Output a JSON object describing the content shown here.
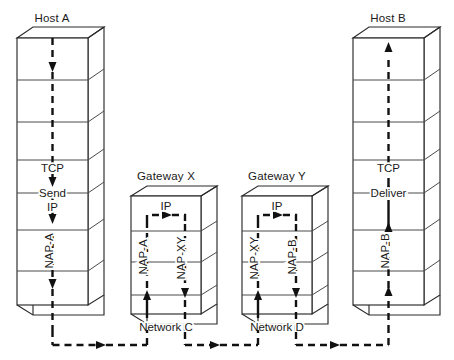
{
  "figure": {
    "kind": "network-protocol-stack-diagram",
    "background_color": "#ffffff",
    "line_color": "#2b2b2b",
    "flow_color": "#111111"
  },
  "nodes": [
    {
      "id": "host-a",
      "title": "Host A",
      "type": "host",
      "layers": 7,
      "direction": "down",
      "labels": [
        {
          "text": "TCP",
          "orientation": "horizontal"
        },
        {
          "text": "Send",
          "orientation": "horizontal"
        },
        {
          "text": "IP",
          "orientation": "horizontal"
        },
        {
          "text": "NAP-A",
          "orientation": "vertical"
        }
      ]
    },
    {
      "id": "gateway-x",
      "title": "Gateway X",
      "type": "gateway",
      "layers": 4,
      "direction": "up-across-down",
      "labels": [
        {
          "text": "IP",
          "orientation": "horizontal"
        },
        {
          "text": "NAP-A",
          "orientation": "vertical"
        },
        {
          "text": "NAP-XY",
          "orientation": "vertical"
        }
      ]
    },
    {
      "id": "gateway-y",
      "title": "Gateway Y",
      "type": "gateway",
      "layers": 4,
      "direction": "up-across-down",
      "labels": [
        {
          "text": "IP",
          "orientation": "horizontal"
        },
        {
          "text": "NAP-XY",
          "orientation": "vertical"
        },
        {
          "text": "NAP-B",
          "orientation": "vertical"
        }
      ]
    },
    {
      "id": "host-b",
      "title": "Host B",
      "type": "host",
      "layers": 7,
      "direction": "up",
      "labels": [
        {
          "text": "TCP",
          "orientation": "horizontal"
        },
        {
          "text": "Deliver",
          "orientation": "horizontal"
        },
        {
          "text": "NAP-B",
          "orientation": "vertical"
        }
      ]
    }
  ],
  "networks": [
    {
      "id": "network-c",
      "label": "Network C",
      "between": [
        "host-a",
        "gateway-x"
      ]
    },
    {
      "id": "network-d",
      "label": "Network D",
      "between": [
        "gateway-x",
        "gateway-y"
      ]
    }
  ],
  "link_labels": {
    "host_a_title": "Host A",
    "host_b_title": "Host B",
    "gateway_x_title": "Gateway X",
    "gateway_y_title": "Gateway Y",
    "network_c": "Network C",
    "network_d": "Network D",
    "tcp_a": "TCP",
    "send": "Send",
    "ip_a": "IP",
    "nap_a_host": "NAP-A",
    "ip_x": "IP",
    "nap_a_x": "NAP-A",
    "nap_xy_x": "NAP-XY",
    "ip_y": "IP",
    "nap_xy_y": "NAP-XY",
    "nap_b_y": "NAP-B",
    "tcp_b": "TCP",
    "deliver": "Deliver",
    "nap_b_host": "NAP-B"
  }
}
